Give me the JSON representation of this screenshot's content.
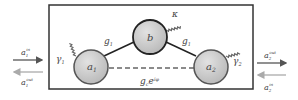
{
  "diagram": {
    "nodes": {
      "a1": {
        "label": "a",
        "sub": "1"
      },
      "b": {
        "label": "b"
      },
      "a2": {
        "label": "a",
        "sub": "2"
      }
    },
    "couplings": {
      "g1": {
        "label": "g",
        "sub": "1"
      },
      "g2": {
        "label": "g",
        "sub": "1"
      },
      "direct": {
        "label": "g",
        "sub": "c",
        "sup": "e",
        "sup2": "iφ"
      }
    },
    "dissipation": {
      "kappa": "κ",
      "gamma1": {
        "label": "γ",
        "sub": "1"
      },
      "gamma2": {
        "label": "γ",
        "sub": "2"
      }
    },
    "ports": {
      "a1_in": {
        "label": "a",
        "sub": "1",
        "sup": "in"
      },
      "a1_out": {
        "label": "a",
        "sub": "1",
        "sup": "out"
      },
      "a2_out": {
        "label": "a",
        "sub": "2",
        "sup": "out"
      },
      "a2_in": {
        "label": "a",
        "sub": "2",
        "sup": "in"
      }
    },
    "colors": {
      "node_fill": "#c8c8c8",
      "node_stroke": "#555555",
      "box": "#333333",
      "arrow_dark": "#555555",
      "arrow_light": "#999999"
    }
  }
}
